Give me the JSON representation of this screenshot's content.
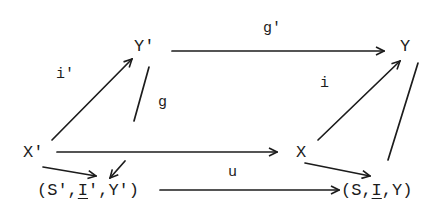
{
  "diagram": {
    "type": "commutative-diagram",
    "nodes": {
      "Y_prime": "Y'",
      "Y": "Y",
      "X_prime": "X'",
      "X": "X",
      "triple_prime": {
        "open": "(S',",
        "I": "I",
        "rest": "',Υ')"
      },
      "triple": {
        "open": "(S,",
        "I": "I",
        "rest": ",Υ)"
      }
    },
    "labels": {
      "g_prime": "g'",
      "i_prime": "i'",
      "g": "g",
      "i": "i",
      "u": "u"
    },
    "edges": [
      {
        "from": "Y'",
        "to": "Y",
        "label": "g'"
      },
      {
        "from": "X'",
        "to": "Y'",
        "label": "i'"
      },
      {
        "from": "X'",
        "to": "X",
        "label": "g"
      },
      {
        "from": "X",
        "to": "Y",
        "label": "i"
      },
      {
        "from": "X'",
        "to": "(S',I',Υ')",
        "label": ""
      },
      {
        "from": "Y'",
        "to": "(S',I',Υ')",
        "label": ""
      },
      {
        "from": "X",
        "to": "(S,I,Υ)",
        "label": ""
      },
      {
        "from": "Y",
        "to": "(S,I,Υ)",
        "label": ""
      },
      {
        "from": "(S',I',Υ')",
        "to": "(S,I,Υ)",
        "label": "u"
      }
    ],
    "colors": {
      "ink": "#1c1c1c",
      "background": "#ffffff"
    }
  }
}
